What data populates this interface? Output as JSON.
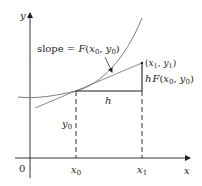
{
  "figure": {
    "colors": {
      "axes": "#231f20",
      "curve": "#6d6e71",
      "tangent": "#6d6e71",
      "construction": "#231f20",
      "background": "#ffffff"
    },
    "axes": {
      "x_label": "x",
      "y_label": "y",
      "origin_label": "0"
    },
    "ticks": {
      "x0": {
        "main": "x",
        "sub": "0"
      },
      "x1": {
        "main": "x",
        "sub": "1"
      }
    },
    "labels": {
      "slope": {
        "prefix": "slope = ",
        "func": "F",
        "open": "(",
        "x": "x",
        "x_sub": "0",
        "comma": ", ",
        "y": "y",
        "y_sub": "0",
        "close": ")"
      },
      "point1": {
        "open": "(",
        "x": "x",
        "x_sub": "1",
        "comma": ", ",
        "y": "y",
        "y_sub": "1",
        "close": ")"
      },
      "rise": {
        "h": "h",
        "func": "F",
        "open": "(",
        "x": "x",
        "x_sub": "0",
        "comma": ", ",
        "y": "y",
        "y_sub": "0",
        "close": ")"
      },
      "run": "h",
      "y0": {
        "main": "y",
        "sub": "0"
      }
    }
  }
}
